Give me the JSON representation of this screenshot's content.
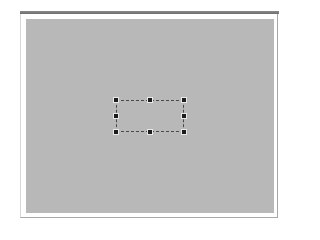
{
  "window": {
    "title_bar_color": "#7a7a7a",
    "canvas_color": "#b8b8b8"
  },
  "selection": {
    "style": "dashed",
    "handles": [
      "top-left",
      "top-center",
      "top-right",
      "middle-left",
      "middle-right",
      "bottom-left",
      "bottom-center",
      "bottom-right"
    ]
  }
}
